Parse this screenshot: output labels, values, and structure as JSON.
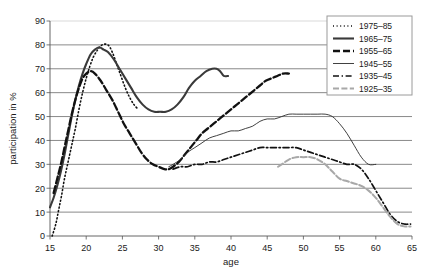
{
  "chart_data": {
    "type": "line",
    "title": "",
    "xlabel": "age",
    "ylabel": "participation in %",
    "xlim": [
      15,
      65
    ],
    "ylim": [
      0,
      90
    ],
    "xticks": [
      15,
      20,
      25,
      30,
      35,
      40,
      45,
      50,
      55,
      60,
      65
    ],
    "yticks": [
      0,
      10,
      20,
      30,
      40,
      50,
      60,
      70,
      80,
      90
    ],
    "grid": "horizontal",
    "legend_position": "top-right",
    "series": [
      {
        "name": "1975–85",
        "style": "dotted",
        "color": "#111111",
        "width": 1.6,
        "points": [
          [
            15.3,
            0
          ],
          [
            15.8,
            5
          ],
          [
            16.2,
            11
          ],
          [
            16.6,
            17
          ],
          [
            17.0,
            24
          ],
          [
            17.5,
            31
          ],
          [
            18.0,
            38
          ],
          [
            18.5,
            45
          ],
          [
            19.0,
            53
          ],
          [
            19.5,
            60
          ],
          [
            20.0,
            66
          ],
          [
            20.5,
            71
          ],
          [
            21.0,
            75
          ],
          [
            21.6,
            78
          ],
          [
            22.2,
            80
          ],
          [
            23.0,
            80
          ],
          [
            23.6,
            77
          ],
          [
            24.2,
            72
          ],
          [
            24.8,
            67
          ],
          [
            25.4,
            62
          ],
          [
            26.0,
            58
          ],
          [
            26.6,
            55
          ],
          [
            27.2,
            53
          ]
        ]
      },
      {
        "name": "1965–75",
        "style": "solid",
        "color": "#3a3a3a",
        "width": 2.1,
        "points": [
          [
            15.0,
            12
          ],
          [
            15.5,
            16
          ],
          [
            16.0,
            21
          ],
          [
            16.5,
            27
          ],
          [
            17.0,
            34
          ],
          [
            17.5,
            42
          ],
          [
            18.0,
            50
          ],
          [
            18.5,
            57
          ],
          [
            19.0,
            63
          ],
          [
            19.5,
            68
          ],
          [
            20.0,
            72
          ],
          [
            20.6,
            76
          ],
          [
            21.2,
            78
          ],
          [
            21.8,
            79
          ],
          [
            22.4,
            78
          ],
          [
            23.0,
            77
          ],
          [
            23.8,
            74
          ],
          [
            24.6,
            70
          ],
          [
            25.4,
            66
          ],
          [
            26.2,
            62
          ],
          [
            27.0,
            58
          ],
          [
            27.8,
            55
          ],
          [
            28.6,
            53
          ],
          [
            29.4,
            52
          ],
          [
            30.2,
            52
          ],
          [
            31.0,
            52
          ],
          [
            31.8,
            53
          ],
          [
            32.6,
            55
          ],
          [
            33.4,
            58
          ],
          [
            34.2,
            62
          ],
          [
            35.0,
            65
          ],
          [
            35.8,
            67
          ],
          [
            36.6,
            69
          ],
          [
            37.4,
            70
          ],
          [
            38.0,
            70
          ],
          [
            38.5,
            69
          ],
          [
            39.0,
            67
          ],
          [
            39.6,
            67
          ]
        ]
      },
      {
        "name": "1955–65",
        "style": "dash-long",
        "color": "#111111",
        "width": 2.3,
        "points": [
          [
            15.5,
            18
          ],
          [
            16.0,
            24
          ],
          [
            16.5,
            30
          ],
          [
            17.0,
            37
          ],
          [
            17.5,
            44
          ],
          [
            18.0,
            51
          ],
          [
            18.5,
            57
          ],
          [
            19.0,
            62
          ],
          [
            19.5,
            66
          ],
          [
            20.0,
            68
          ],
          [
            20.6,
            69
          ],
          [
            21.2,
            68
          ],
          [
            22.0,
            65
          ],
          [
            22.8,
            61
          ],
          [
            23.6,
            57
          ],
          [
            24.4,
            52
          ],
          [
            25.2,
            47
          ],
          [
            26.0,
            43
          ],
          [
            26.8,
            39
          ],
          [
            27.6,
            35
          ],
          [
            28.4,
            32
          ],
          [
            29.2,
            30
          ],
          [
            30.0,
            29
          ],
          [
            30.8,
            28
          ],
          [
            31.4,
            28
          ],
          [
            32.0,
            29
          ],
          [
            32.8,
            31
          ],
          [
            33.6,
            34
          ],
          [
            34.4,
            37
          ],
          [
            35.2,
            40
          ],
          [
            36.0,
            43
          ],
          [
            36.8,
            45
          ],
          [
            37.6,
            47
          ],
          [
            38.4,
            49
          ],
          [
            39.2,
            51
          ],
          [
            40.0,
            53
          ],
          [
            40.8,
            55
          ],
          [
            41.6,
            57
          ],
          [
            42.4,
            59
          ],
          [
            43.2,
            61
          ],
          [
            44.0,
            63
          ],
          [
            44.8,
            65
          ],
          [
            45.6,
            66
          ],
          [
            46.4,
            67
          ],
          [
            47.2,
            68
          ],
          [
            48.0,
            68
          ]
        ]
      },
      {
        "name": "1945–55",
        "style": "solid",
        "color": "#2b2b2b",
        "width": 0.9,
        "points": [
          [
            31.4,
            29
          ],
          [
            32.0,
            30
          ],
          [
            33.0,
            32
          ],
          [
            34.0,
            35
          ],
          [
            35.0,
            37
          ],
          [
            36.0,
            39
          ],
          [
            37.0,
            41
          ],
          [
            38.0,
            42
          ],
          [
            39.0,
            43
          ],
          [
            40.0,
            44
          ],
          [
            41.0,
            44
          ],
          [
            42.0,
            45
          ],
          [
            43.0,
            46
          ],
          [
            44.0,
            48
          ],
          [
            45.0,
            49
          ],
          [
            46.0,
            49
          ],
          [
            47.0,
            50
          ],
          [
            48.0,
            51
          ],
          [
            49.0,
            51
          ],
          [
            50.0,
            51
          ],
          [
            51.0,
            51
          ],
          [
            52.0,
            51
          ],
          [
            53.0,
            51
          ],
          [
            54.0,
            50
          ],
          [
            55.0,
            47
          ],
          [
            56.0,
            43
          ],
          [
            57.0,
            38
          ],
          [
            58.0,
            33
          ],
          [
            59.0,
            30
          ],
          [
            60.0,
            30
          ]
        ]
      },
      {
        "name": "1935–45",
        "style": "dash-dot",
        "color": "#111111",
        "width": 1.7,
        "points": [
          [
            32.0,
            28
          ],
          [
            33.0,
            29
          ],
          [
            34.0,
            29
          ],
          [
            35.0,
            30
          ],
          [
            36.0,
            30
          ],
          [
            37.0,
            31
          ],
          [
            38.0,
            31
          ],
          [
            39.0,
            32
          ],
          [
            40.0,
            33
          ],
          [
            41.0,
            34
          ],
          [
            42.0,
            35
          ],
          [
            43.0,
            36
          ],
          [
            44.0,
            37
          ],
          [
            45.0,
            37
          ],
          [
            46.0,
            37
          ],
          [
            47.0,
            37
          ],
          [
            48.0,
            37
          ],
          [
            49.0,
            37
          ],
          [
            50.0,
            36
          ],
          [
            51.0,
            35
          ],
          [
            52.0,
            34
          ],
          [
            53.0,
            33
          ],
          [
            54.0,
            32
          ],
          [
            55.0,
            31
          ],
          [
            56.0,
            30
          ],
          [
            57.0,
            30
          ],
          [
            58.0,
            28
          ],
          [
            59.0,
            24
          ],
          [
            60.0,
            19
          ],
          [
            61.0,
            14
          ],
          [
            62.0,
            9
          ],
          [
            63.0,
            6
          ],
          [
            64.0,
            5
          ],
          [
            64.8,
            5
          ]
        ]
      },
      {
        "name": "1925–35",
        "style": "dash-gray",
        "color": "#a8a8a8",
        "width": 2.0,
        "points": [
          [
            46.5,
            29
          ],
          [
            47.0,
            30
          ],
          [
            48.0,
            32
          ],
          [
            49.0,
            33
          ],
          [
            50.0,
            33
          ],
          [
            51.0,
            33
          ],
          [
            52.0,
            32
          ],
          [
            53.0,
            30
          ],
          [
            54.0,
            27
          ],
          [
            55.0,
            24
          ],
          [
            56.0,
            23
          ],
          [
            57.0,
            22
          ],
          [
            58.0,
            21
          ],
          [
            59.0,
            19
          ],
          [
            60.0,
            16
          ],
          [
            61.0,
            12
          ],
          [
            62.0,
            8
          ],
          [
            63.0,
            5
          ],
          [
            64.0,
            4
          ],
          [
            64.8,
            4
          ]
        ]
      }
    ]
  },
  "legend": {
    "entries": [
      {
        "label": "1975–85"
      },
      {
        "label": "1965–75"
      },
      {
        "label": "1955–65"
      },
      {
        "label": "1945–55"
      },
      {
        "label": "1935–45"
      },
      {
        "label": "1925–35"
      }
    ]
  },
  "colors": {
    "axis": "#555555",
    "grid": "#6b6b6b",
    "grid_top": "#cfcfcf",
    "text": "#1a1a1a",
    "legend_border": "#9a9a9a",
    "background": "#ffffff"
  }
}
